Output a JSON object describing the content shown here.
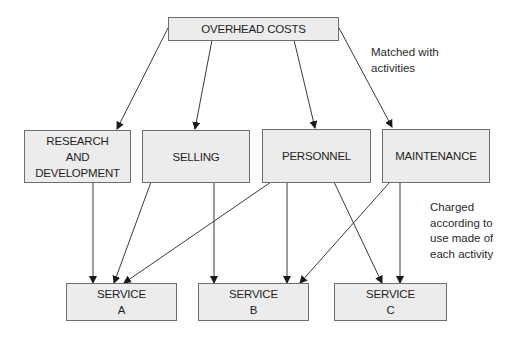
{
  "diagram": {
    "top": {
      "label": "OVERHEAD COSTS"
    },
    "activities": [
      {
        "lines": [
          "RESEARCH",
          "AND",
          "DEVELOPMENT"
        ]
      },
      {
        "lines": [
          "SELLING"
        ]
      },
      {
        "lines": [
          "PERSONNEL"
        ]
      },
      {
        "lines": [
          "MAINTENANCE"
        ]
      }
    ],
    "services": [
      {
        "lines": [
          "SERVICE",
          "A"
        ]
      },
      {
        "lines": [
          "SERVICE",
          "B"
        ]
      },
      {
        "lines": [
          "SERVICE",
          "C"
        ]
      }
    ],
    "notes": {
      "matched": [
        "Matched with",
        "activities"
      ],
      "charged": [
        "Charged",
        "according to",
        "use made of",
        "each activity"
      ]
    },
    "colors": {
      "box_fill": "#ececec",
      "box_border": "#6e6e6e",
      "line": "#3a3a3a"
    }
  }
}
